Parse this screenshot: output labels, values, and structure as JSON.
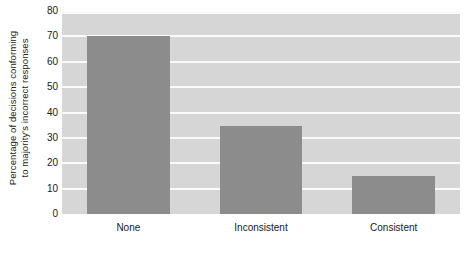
{
  "chart_data": {
    "type": "bar",
    "title": "",
    "subtitle": "",
    "xlabel": "",
    "ylabel_lines": [
      "Percentage of decisions conforming",
      "to majority's incorrect responses"
    ],
    "categories": [
      "None",
      "Inconsistent",
      "Consistent"
    ],
    "values": [
      70,
      34.5,
      15
    ],
    "ylim": [
      0,
      80
    ],
    "yticks": [
      0,
      10,
      20,
      30,
      40,
      50,
      60,
      70,
      80
    ],
    "ytick_labels": [
      "0",
      "10",
      "20",
      "30",
      "40",
      "50",
      "60",
      "70",
      "80"
    ],
    "grid": true,
    "grid_axis": "y",
    "legend": false,
    "legend_position": "none",
    "annotations": [],
    "colors": {
      "bar_fill": "#8c8c8c",
      "plot_background": "#d6d6d6",
      "gridline": "#fbfbfb",
      "page_background": "#ffffff",
      "text": "#1a1a1a"
    }
  }
}
